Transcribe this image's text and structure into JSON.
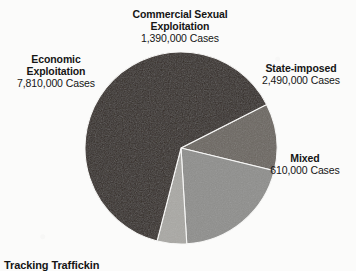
{
  "figure": {
    "caption": "Tracking Traffickin",
    "background_color": "#fbfbfa",
    "text_color": "#151515"
  },
  "chart_data": {
    "type": "pie",
    "title": "",
    "subtitle": "",
    "unit": "Cases",
    "total": 12300000,
    "legend_position": "outside-callout-labels",
    "grid": false,
    "start_angle_deg": -27,
    "direction": "clockwise",
    "categories": [
      "Commercial Sexual Exploitation",
      "State-imposed",
      "Mixed",
      "Economic Exploitation"
    ],
    "values": [
      1390000,
      2490000,
      610000,
      7810000
    ],
    "value_labels": [
      "1,390,000 Cases",
      "2,490,000 Cases",
      "610,000 Cases",
      "7,810,000 Cases"
    ],
    "percentages": [
      11.3,
      20.2,
      5.0,
      63.5
    ],
    "colors": [
      "#6b6660",
      "#8e8e8c",
      "#a9a8a4",
      "#332b26"
    ],
    "slices": [
      {
        "name": "Commercial Sexual Exploitation",
        "label_line1": "Commercial Sexual",
        "label_line2": "Exploitation",
        "value": 1390000,
        "value_label": "1,390,000 Cases",
        "percent": 11.3,
        "color": "#6b6660"
      },
      {
        "name": "State-imposed",
        "label_line1": "State-imposed",
        "label_line2": "",
        "value": 2490000,
        "value_label": "2,490,000 Cases",
        "percent": 20.2,
        "color": "#8e8e8c"
      },
      {
        "name": "Mixed",
        "label_line1": "Mixed",
        "label_line2": "",
        "value": 610000,
        "value_label": "610,000 Cases",
        "percent": 5.0,
        "color": "#a9a8a4"
      },
      {
        "name": "Economic Exploitation",
        "label_line1": "Economic",
        "label_line2": "Exploitation",
        "value": 7810000,
        "value_label": "7,810,000 Cases",
        "percent": 63.5,
        "color": "#332b26"
      }
    ]
  }
}
